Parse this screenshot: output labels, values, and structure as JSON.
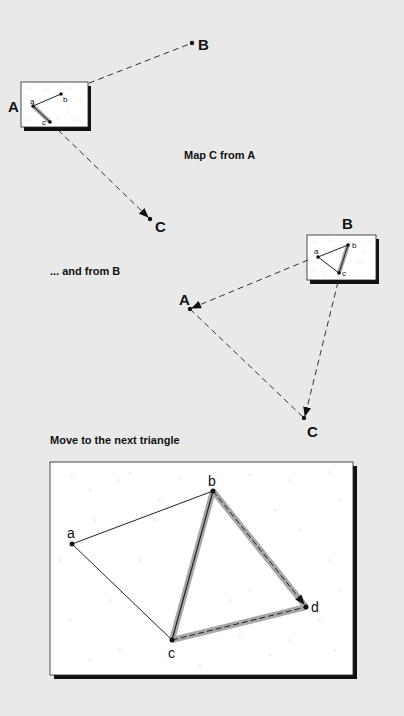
{
  "captions": {
    "map_c_from_a": "Map C from A",
    "and_from_b": "... and from B",
    "move_next": "Move to the next triangle"
  },
  "labels": {
    "panel1": {
      "A": "A",
      "B": "B",
      "C": "C",
      "a": "a",
      "b": "b",
      "c": "c"
    },
    "panel2": {
      "A": "A",
      "B": "B",
      "C": "C",
      "a": "a",
      "b": "b",
      "c": "c"
    },
    "panel3": {
      "a": "a",
      "b": "b",
      "c": "c",
      "d": "d"
    }
  },
  "colors": {
    "background": "#e9e9e9",
    "box_fill": "#ffffff",
    "box_shadow": "#111111",
    "ink": "#111111",
    "highlight": "#9a9a9a"
  }
}
